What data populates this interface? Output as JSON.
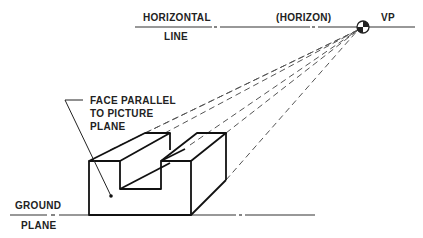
{
  "diagram": {
    "type": "one-point-perspective",
    "labels": {
      "horizontal_line_top": "HORIZONTAL",
      "horizontal_line_bottom": "LINE",
      "horizon": "(HORIZON)",
      "vanishing_point": "VP",
      "face_parallel_1": "FACE PARALLEL",
      "face_parallel_2": "TO PICTURE",
      "face_parallel_3": "PLANE",
      "ground_top": "GROUND",
      "ground_bottom": "PLANE"
    },
    "colors": {
      "line": "#1a1a1a",
      "dashed": "#555555",
      "background": "#ffffff"
    }
  }
}
